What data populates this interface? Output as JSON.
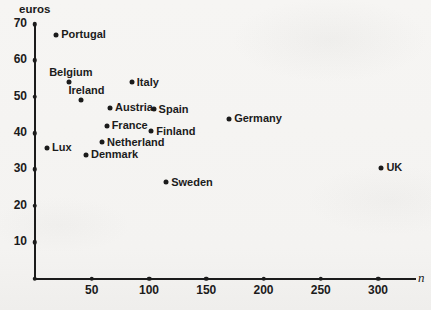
{
  "page": {
    "background": "#f4f3f1",
    "ink": "#1b1b1b"
  },
  "chart_data": {
    "type": "scatter",
    "title": "",
    "xlabel": "n",
    "ylabel": "euros",
    "x_ticks": [
      50,
      100,
      150,
      200,
      250,
      300
    ],
    "y_ticks": [
      10,
      20,
      30,
      40,
      50,
      60,
      70
    ],
    "xlim": [
      0,
      333
    ],
    "ylim": [
      0,
      70
    ],
    "grid": false,
    "legend": false,
    "marker_color": "#1b1b1b",
    "points": [
      {
        "label": "Portugal",
        "n": 19,
        "euros": 67,
        "label_pos": "right"
      },
      {
        "label": "Belgium",
        "n": 30,
        "euros": 54,
        "label_pos": "above",
        "label_dx": 2
      },
      {
        "label": "Italy",
        "n": 85,
        "euros": 54,
        "label_pos": "right"
      },
      {
        "label": "Ireland",
        "n": 41,
        "euros": 49,
        "label_pos": "above",
        "label_dx": 5
      },
      {
        "label": "Austria",
        "n": 66,
        "euros": 47,
        "label_pos": "right"
      },
      {
        "label": "Spain",
        "n": 104,
        "euros": 46.5,
        "label_pos": "right"
      },
      {
        "label": "France",
        "n": 63,
        "euros": 42,
        "label_pos": "right"
      },
      {
        "label": "Germany",
        "n": 170,
        "euros": 44,
        "label_pos": "right"
      },
      {
        "label": "Finland",
        "n": 102,
        "euros": 40.5,
        "label_pos": "right"
      },
      {
        "label": "Netherland",
        "n": 59,
        "euros": 37.5,
        "label_pos": "right"
      },
      {
        "label": "Lux",
        "n": 11,
        "euros": 36,
        "label_pos": "right"
      },
      {
        "label": "Denmark",
        "n": 45,
        "euros": 34,
        "label_pos": "right"
      },
      {
        "label": "Sweden",
        "n": 115,
        "euros": 26.5,
        "label_pos": "right"
      },
      {
        "label": "UK",
        "n": 303,
        "euros": 30.5,
        "label_pos": "right"
      }
    ]
  }
}
